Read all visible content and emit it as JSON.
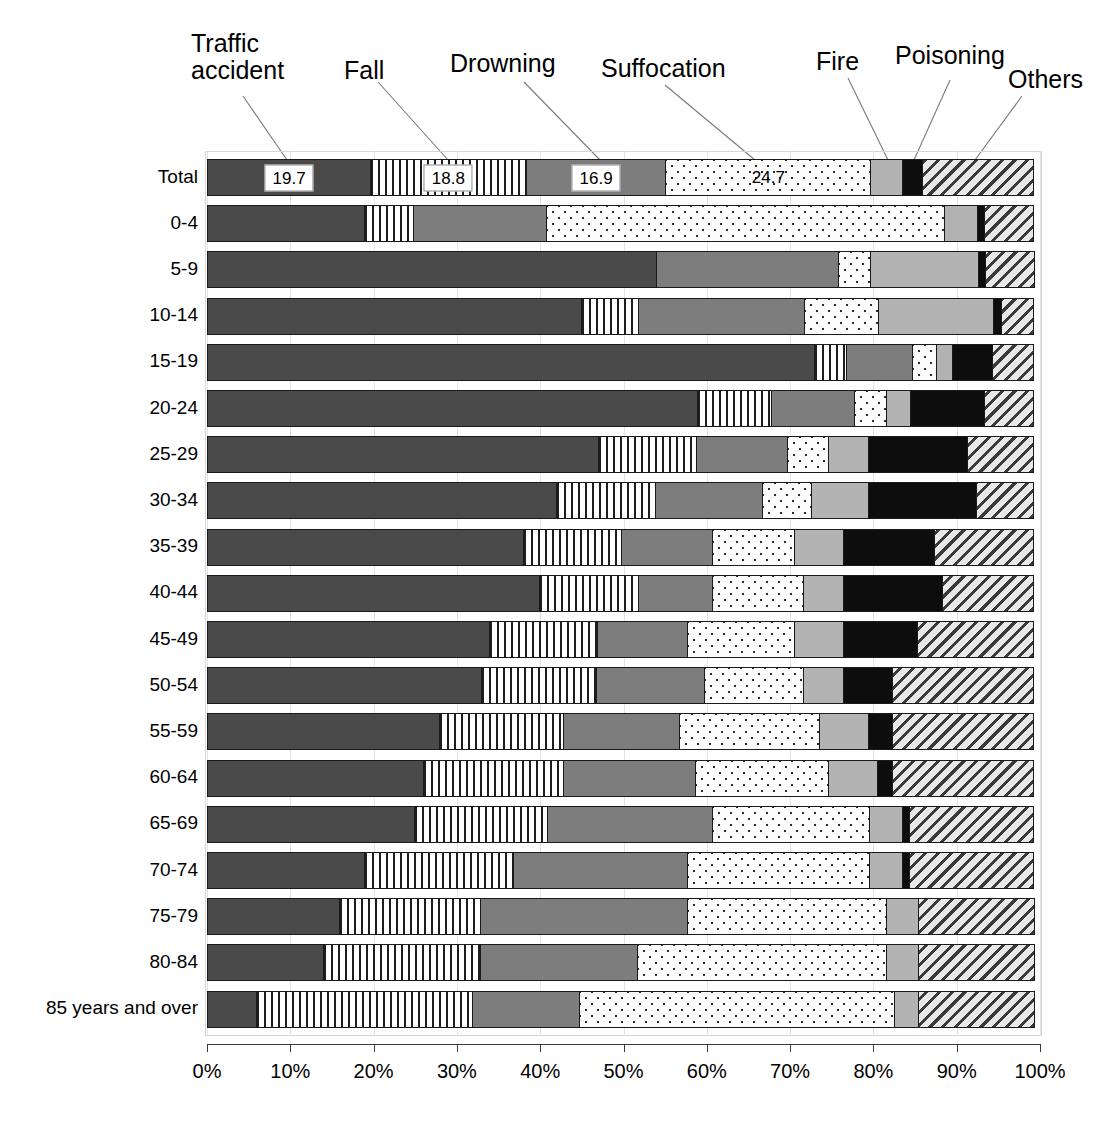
{
  "chart_data": {
    "type": "bar",
    "orientation": "horizontal",
    "stacked": true,
    "stack_mode": "percent",
    "title": "",
    "xlabel": "",
    "ylabel": "",
    "xlim": [
      0,
      100
    ],
    "x_tick_labels": [
      "0%",
      "10%",
      "20%",
      "30%",
      "40%",
      "50%",
      "60%",
      "70%",
      "80%",
      "90%",
      "100%"
    ],
    "x_tick_values": [
      0,
      10,
      20,
      30,
      40,
      50,
      60,
      70,
      80,
      90,
      100
    ],
    "grid": true,
    "legend_position": "callouts-above-total-bar",
    "categories": [
      "Total",
      "0-4",
      "5-9",
      "10-14",
      "15-19",
      "20-24",
      "25-29",
      "30-34",
      "35-39",
      "40-44",
      "45-49",
      "50-54",
      "55-59",
      "60-64",
      "65-69",
      "70-74",
      "75-79",
      "80-84",
      "85 years and over"
    ],
    "series": [
      {
        "name": "Traffic accident",
        "fill": "solid-dark-gray",
        "color": "#4a4a4a",
        "values": [
          19.7,
          19.0,
          54.0,
          45.0,
          73.0,
          59.0,
          47.0,
          42.0,
          38.0,
          40.0,
          34.0,
          33.0,
          28.0,
          26.0,
          25.0,
          19.0,
          16.0,
          14.0,
          6.0
        ]
      },
      {
        "name": "Fall",
        "fill": "vertical-stripes",
        "color": "#ffffff",
        "values": [
          18.8,
          6.0,
          0.0,
          7.0,
          4.0,
          9.0,
          12.0,
          12.0,
          12.0,
          12.0,
          13.0,
          14.0,
          15.0,
          17.0,
          16.0,
          18.0,
          17.0,
          19.0,
          26.0
        ]
      },
      {
        "name": "Drowning",
        "fill": "solid-medium-gray",
        "color": "#7d7d7d",
        "values": [
          16.9,
          16.0,
          22.0,
          20.0,
          8.0,
          10.0,
          11.0,
          13.0,
          11.0,
          9.0,
          11.0,
          13.0,
          14.0,
          16.0,
          20.0,
          21.0,
          25.0,
          19.0,
          13.0
        ]
      },
      {
        "name": "Suffocation",
        "fill": "dotted",
        "color": "#fcfcfc",
        "values": [
          24.7,
          48.0,
          4.0,
          9.0,
          3.0,
          4.0,
          5.0,
          6.0,
          10.0,
          11.0,
          13.0,
          12.0,
          17.0,
          16.0,
          19.0,
          22.0,
          24.0,
          30.0,
          38.0
        ]
      },
      {
        "name": "Fire",
        "fill": "solid-light-gray",
        "color": "#b3b3b3",
        "values": [
          3.9,
          4.0,
          13.0,
          14.0,
          2.0,
          3.0,
          5.0,
          7.0,
          6.0,
          5.0,
          6.0,
          5.0,
          6.0,
          6.0,
          4.0,
          4.0,
          4.0,
          4.0,
          3.0
        ]
      },
      {
        "name": "Poisoning",
        "fill": "solid-black",
        "color": "#0d0d0d",
        "values": [
          2.5,
          1.0,
          1.0,
          1.0,
          5.0,
          9.0,
          12.0,
          13.0,
          11.0,
          12.0,
          9.0,
          6.0,
          3.0,
          2.0,
          1.0,
          1.0,
          0.0,
          0.0,
          0.0
        ]
      },
      {
        "name": "Others",
        "fill": "diagonal-hatch",
        "color": "#d9d9d9",
        "values": [
          13.5,
          6.0,
          6.0,
          4.0,
          5.0,
          6.0,
          8.0,
          7.0,
          12.0,
          11.0,
          14.0,
          17.0,
          17.0,
          17.0,
          15.0,
          15.0,
          14.0,
          14.0,
          14.0
        ]
      }
    ],
    "data_labels": {
      "row": "Total",
      "entries": [
        {
          "series": "Traffic accident",
          "text": "19.7",
          "boxed": true
        },
        {
          "series": "Fall",
          "text": "18.8",
          "boxed": true
        },
        {
          "series": "Drowning",
          "text": "16.9",
          "boxed": true
        },
        {
          "series": "Suffocation",
          "text": "24.7",
          "boxed": false
        }
      ]
    },
    "callouts": [
      {
        "label": "Traffic\naccident",
        "line_1": "Traffic",
        "line_2": "accident",
        "target_series": "Traffic accident"
      },
      {
        "label": "Fall",
        "target_series": "Fall"
      },
      {
        "label": "Drowning",
        "target_series": "Drowning"
      },
      {
        "label": "Suffocation",
        "target_series": "Suffocation"
      },
      {
        "label": "Fire",
        "target_series": "Fire"
      },
      {
        "label": "Poisoning",
        "target_series": "Poisoning"
      },
      {
        "label": "Others",
        "target_series": "Others"
      }
    ]
  },
  "labels": {
    "traffic_line1": "Traffic",
    "traffic_line2": "accident",
    "fall": "Fall",
    "drowning": "Drowning",
    "suffocation": "Suffocation",
    "fire": "Fire",
    "poisoning": "Poisoning",
    "others": "Others"
  },
  "values": {
    "total_traffic": "19.7",
    "total_fall": "18.8",
    "total_drowning": "16.9",
    "total_suffocation": "24.7"
  }
}
